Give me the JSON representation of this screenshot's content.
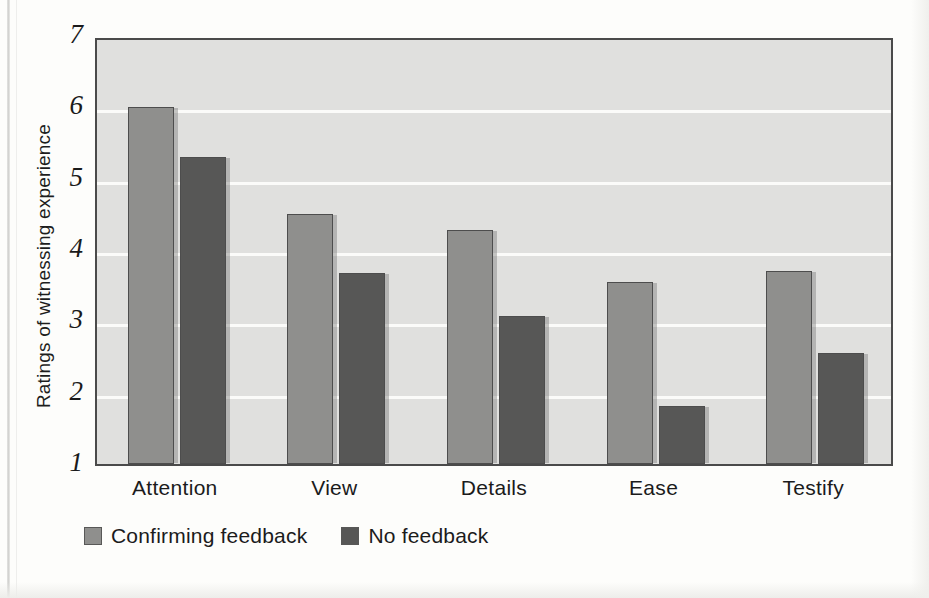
{
  "chart_data": {
    "type": "bar",
    "title": "",
    "xlabel": "",
    "ylabel": "Ratings of witnessing experience",
    "categories": [
      "Attention",
      "View",
      "Details",
      "Ease",
      "Testify"
    ],
    "series": [
      {
        "name": "Confirming feedback",
        "color": "#8f8f8d",
        "values": [
          6.0,
          4.5,
          4.28,
          3.55,
          3.7
        ]
      },
      {
        "name": "No feedback",
        "color": "#575756",
        "values": [
          5.3,
          3.68,
          3.07,
          1.82,
          2.55
        ]
      }
    ],
    "ylim": [
      1,
      7
    ],
    "yticks": [
      1,
      2,
      3,
      4,
      5,
      6,
      7
    ],
    "ytick_labels": [
      "1",
      "2",
      "3",
      "4",
      "5",
      "6",
      "7"
    ],
    "grid": true,
    "gridlines_at": [
      2,
      3,
      4,
      5,
      6
    ],
    "legend_position": "below-axis-left",
    "plot_background": "#e0e0de",
    "gridline_color": "#fbfbf9",
    "axis_color": "#4a4a4a"
  }
}
